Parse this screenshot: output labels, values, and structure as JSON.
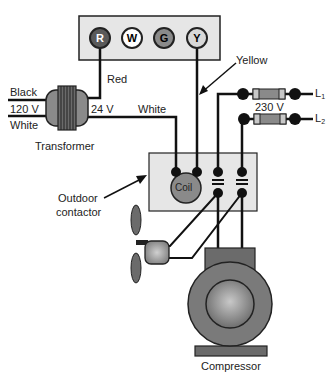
{
  "diagram": {
    "type": "wiring-schematic",
    "thermostat": {
      "terminals": [
        {
          "letter": "R",
          "fill": "#5a5a5a",
          "text_color": "#ffffff"
        },
        {
          "letter": "W",
          "fill": "#ffffff",
          "text_color": "#222222"
        },
        {
          "letter": "G",
          "fill": "#8a8a8a",
          "text_color": "#222222"
        },
        {
          "letter": "Y",
          "fill": "#d8d8d8",
          "text_color": "#222222"
        }
      ]
    },
    "labels": {
      "red": "Red",
      "yellow": "Yellow",
      "black": "Black",
      "v120": "120 V",
      "white_in": "White",
      "v24": "24 V",
      "white_out": "White",
      "transformer": "Transformer",
      "outdoor": "Outdoor",
      "contactor": "contactor",
      "coil": "Coil",
      "v230": "230 V",
      "l1": "L",
      "l1_sub": "1",
      "l2": "L",
      "l2_sub": "2",
      "compressor": "Compressor"
    },
    "colors": {
      "line": "#111111",
      "panel": "#e6e6e6",
      "dark_gray": "#6b6b6b",
      "mid_gray": "#8c8c8c"
    }
  }
}
